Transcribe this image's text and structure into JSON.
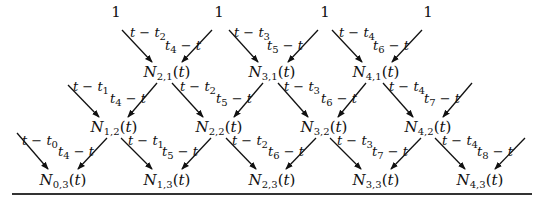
{
  "diagram": {
    "title": "",
    "ones": [
      {
        "text": "1",
        "x": 116,
        "y": 12
      },
      {
        "text": "1",
        "x": 219,
        "y": 12
      },
      {
        "text": "1",
        "x": 325,
        "y": 12
      },
      {
        "text": "1",
        "x": 428,
        "y": 12
      }
    ],
    "nodes": [
      {
        "name": "N",
        "i": "2",
        "k": "1",
        "arg": "t",
        "x": 167,
        "y": 73
      },
      {
        "name": "N",
        "i": "3",
        "k": "1",
        "arg": "t",
        "x": 272,
        "y": 73
      },
      {
        "name": "N",
        "i": "4",
        "k": "1",
        "arg": "t",
        "x": 376,
        "y": 73
      },
      {
        "name": "N",
        "i": "1",
        "k": "2",
        "arg": "t",
        "x": 114,
        "y": 128
      },
      {
        "name": "N",
        "i": "2",
        "k": "2",
        "arg": "t",
        "x": 219,
        "y": 128
      },
      {
        "name": "N",
        "i": "3",
        "k": "2",
        "arg": "t",
        "x": 324,
        "y": 128
      },
      {
        "name": "N",
        "i": "4",
        "k": "2",
        "arg": "t",
        "x": 428,
        "y": 128
      },
      {
        "name": "N",
        "i": "0",
        "k": "3",
        "arg": "t",
        "x": 63,
        "y": 181
      },
      {
        "name": "N",
        "i": "1",
        "k": "3",
        "arg": "t",
        "x": 167,
        "y": 181
      },
      {
        "name": "N",
        "i": "2",
        "k": "3",
        "arg": "t",
        "x": 272,
        "y": 181
      },
      {
        "name": "N",
        "i": "3",
        "k": "3",
        "arg": "t",
        "x": 376,
        "y": 181
      },
      {
        "name": "N",
        "i": "4",
        "k": "3",
        "arg": "t",
        "x": 480,
        "y": 181
      }
    ],
    "labels": [
      {
        "pre": "t − t",
        "sub": "2",
        "post": "",
        "x": 148,
        "y": 34
      },
      {
        "pre": "t",
        "sub": "4",
        "post": " − t",
        "x": 183,
        "y": 47
      },
      {
        "pre": "t − t",
        "sub": "3",
        "post": "",
        "x": 252,
        "y": 34
      },
      {
        "pre": "t",
        "sub": "5",
        "post": " − t",
        "x": 285,
        "y": 47
      },
      {
        "pre": "t − t",
        "sub": "4",
        "post": "",
        "x": 357,
        "y": 34
      },
      {
        "pre": "t",
        "sub": "6",
        "post": " − t",
        "x": 391,
        "y": 47
      },
      {
        "pre": "t − t",
        "sub": "1",
        "post": "",
        "x": 91,
        "y": 88
      },
      {
        "pre": "t",
        "sub": "4",
        "post": " − t",
        "x": 128,
        "y": 100
      },
      {
        "pre": "t − t",
        "sub": "2",
        "post": "",
        "x": 198,
        "y": 88
      },
      {
        "pre": "t",
        "sub": "5",
        "post": " − t",
        "x": 234,
        "y": 100
      },
      {
        "pre": "t − t",
        "sub": "3",
        "post": "",
        "x": 302,
        "y": 88
      },
      {
        "pre": "t",
        "sub": "6",
        "post": " − t",
        "x": 339,
        "y": 100
      },
      {
        "pre": "t − t",
        "sub": "4",
        "post": "",
        "x": 407,
        "y": 88
      },
      {
        "pre": "t",
        "sub": "7",
        "post": " − t",
        "x": 442,
        "y": 100
      },
      {
        "pre": "t − t",
        "sub": "0",
        "post": "",
        "x": 40,
        "y": 142
      },
      {
        "pre": "t",
        "sub": "4",
        "post": " − t",
        "x": 76,
        "y": 153
      },
      {
        "pre": "t − t",
        "sub": "1",
        "post": "",
        "x": 146,
        "y": 142
      },
      {
        "pre": "t",
        "sub": "5",
        "post": " − t",
        "x": 180,
        "y": 153
      },
      {
        "pre": "t − t",
        "sub": "2",
        "post": "",
        "x": 250,
        "y": 142
      },
      {
        "pre": "t",
        "sub": "6",
        "post": " − t",
        "x": 286,
        "y": 153
      },
      {
        "pre": "t − t",
        "sub": "3",
        "post": "",
        "x": 355,
        "y": 142
      },
      {
        "pre": "t",
        "sub": "7",
        "post": " − t",
        "x": 390,
        "y": 153
      },
      {
        "pre": "t − t",
        "sub": "4",
        "post": "",
        "x": 460,
        "y": 142
      },
      {
        "pre": "t",
        "sub": "8",
        "post": " − t",
        "x": 495,
        "y": 153
      }
    ],
    "arrows": [
      [
        122,
        30,
        152,
        62
      ],
      [
        212,
        30,
        182,
        62
      ],
      [
        229,
        30,
        258,
        62
      ],
      [
        318,
        30,
        288,
        62
      ],
      [
        332,
        30,
        362,
        62
      ],
      [
        422,
        30,
        392,
        62
      ],
      [
        68,
        85,
        99,
        117
      ],
      [
        157,
        83,
        128,
        117
      ],
      [
        172,
        83,
        203,
        117
      ],
      [
        263,
        83,
        234,
        117
      ],
      [
        278,
        83,
        308,
        117
      ],
      [
        366,
        83,
        338,
        117
      ],
      [
        383,
        83,
        413,
        117
      ],
      [
        472,
        83,
        443,
        117
      ],
      [
        17,
        133,
        48,
        169
      ],
      [
        107,
        138,
        78,
        169
      ],
      [
        121,
        138,
        152,
        169
      ],
      [
        211,
        138,
        182,
        169
      ],
      [
        226,
        138,
        256,
        169
      ],
      [
        316,
        138,
        286,
        169
      ],
      [
        330,
        138,
        361,
        169
      ],
      [
        421,
        138,
        391,
        169
      ],
      [
        435,
        138,
        465,
        169
      ],
      [
        525,
        138,
        495,
        169
      ]
    ],
    "colors": {
      "ink": "#111111",
      "rule": "#333333",
      "background": "#ffffff"
    }
  }
}
